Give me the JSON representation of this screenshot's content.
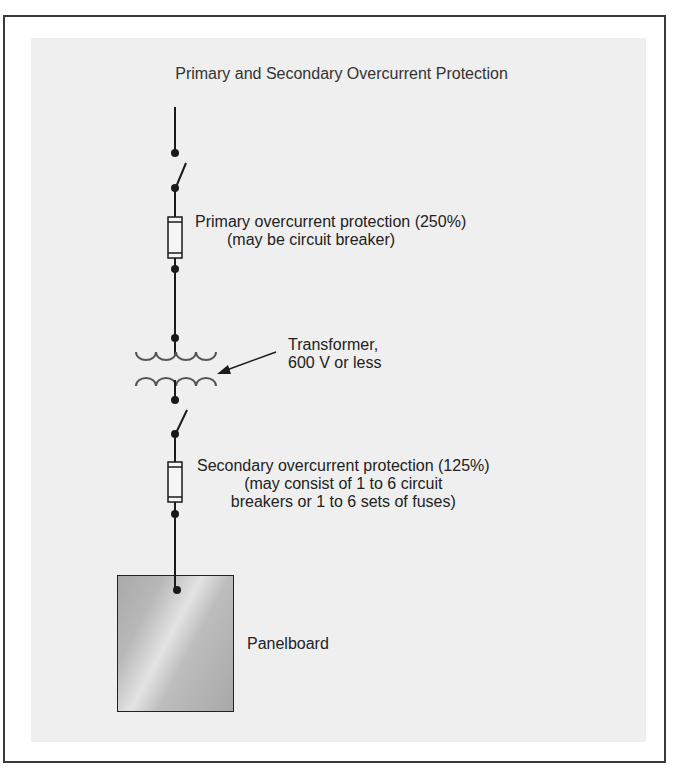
{
  "diagram": {
    "title": "Primary and Secondary Overcurrent Protection",
    "primary_protection": {
      "line1": "Primary overcurrent protection (250%)",
      "line2": "(may be circuit breaker)"
    },
    "transformer": {
      "line1": "Transformer,",
      "line2": "600 V or less"
    },
    "secondary_protection": {
      "line1": "Secondary overcurrent protection (125%)",
      "line2": "(may consist of 1 to 6 circuit",
      "line3": "breakers or 1 to 6 sets of fuses)"
    },
    "panelboard": {
      "label": "Panelboard"
    },
    "colors": {
      "wire": "#1a1a1a",
      "coil": "#555555",
      "background": "#efefef",
      "border": "#3a3a3a"
    }
  }
}
